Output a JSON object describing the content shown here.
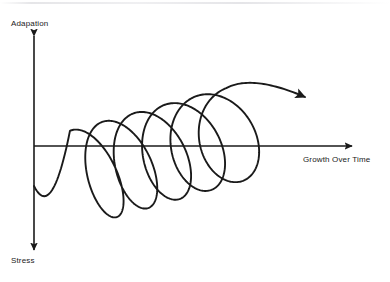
{
  "diagram": {
    "type": "spiral-helix-axes-diagram",
    "background_color": "#ffffff",
    "stroke_color": "#1a1a1a",
    "axes": {
      "vertical": {
        "label_top": "Adapation",
        "label_bottom": "Stress",
        "x": 34,
        "y_top": 36,
        "y_bottom": 250,
        "arrow_top": true,
        "arrow_bottom": true,
        "stroke_width": 1.6
      },
      "horizontal": {
        "label": "Growth Over Time",
        "y": 146,
        "x_left": 34,
        "x_right": 352,
        "arrow_right": true,
        "stroke_width": 1.6
      },
      "origin": {
        "x": 34,
        "y": 146
      }
    },
    "spiral": {
      "loops": 5,
      "start": {
        "x": 34,
        "y": 186
      },
      "end_arrow_tip": {
        "x": 305,
        "y": 97
      },
      "stroke_width": 1.9,
      "tilt_degrees": -18,
      "center_x_start": 86,
      "center_x_end": 243,
      "center_y_start": 176,
      "center_y_end": 132,
      "radius_x_start": 21,
      "radius_x_end": 38,
      "radius_y_start": 48,
      "radius_y_end": 47,
      "samples_per_loop": 180,
      "loop_centers_x": [
        86,
        122,
        158,
        198,
        243
      ],
      "loop_extent_first": {
        "x_min": 65,
        "x_max": 107,
        "y_min": 127,
        "y_max": 223
      },
      "loop_extent_last": {
        "x_min": 205,
        "x_max": 281,
        "y_min": 85,
        "y_max": 179
      }
    }
  },
  "labels": {
    "adaptation": "Adapation",
    "stress": "Stress",
    "growth": "Growth Over Time"
  }
}
